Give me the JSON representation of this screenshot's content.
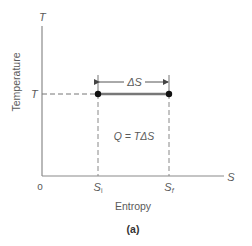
{
  "figure": {
    "caption": "(a)",
    "y_axis": {
      "symbol": "T",
      "label": "Temperature"
    },
    "x_axis": {
      "symbol": "S",
      "label": "Entropy",
      "origin": "o"
    },
    "level_label": "T",
    "points": [
      {
        "label_base": "S",
        "label_sub": "i"
      },
      {
        "label_base": "S",
        "label_sub": "f"
      }
    ],
    "delta_label": "ΔS",
    "heat_equation": "Q = TΔS",
    "colors": {
      "line": "#8a8a8a",
      "dot": "#111111",
      "text": "#5a5a5a"
    }
  }
}
